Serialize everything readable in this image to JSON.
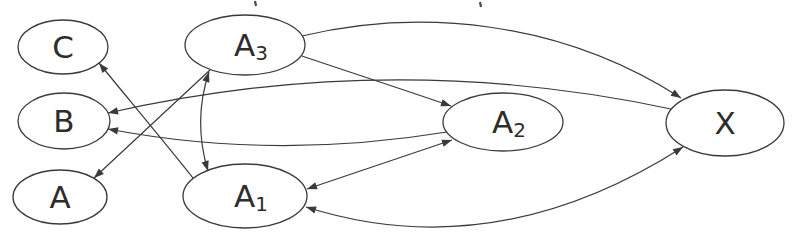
{
  "figure": {
    "type": "directed-graph",
    "width": 793,
    "height": 239,
    "background": "#ffffff",
    "stroke_color": "#3a3a3a",
    "text_color": "#2d2d2d",
    "node_fill": "#ffffff",
    "node_stroke_width": 1.3,
    "edge_stroke_width": 1.2,
    "label_font_size": 31,
    "subscript_font_size": 20,
    "arrow_length": 10,
    "arrow_half_width": 3.7,
    "nodes": [
      {
        "id": "C",
        "label": "C",
        "sub": "",
        "cx": 63,
        "cy": 47,
        "rx": 45,
        "ry": 27
      },
      {
        "id": "B",
        "label": "B",
        "sub": "",
        "cx": 64,
        "cy": 121,
        "rx": 46,
        "ry": 28
      },
      {
        "id": "A",
        "label": "A",
        "sub": "",
        "cx": 60,
        "cy": 197,
        "rx": 47,
        "ry": 27
      },
      {
        "id": "A3",
        "label": "A",
        "sub": "3",
        "cx": 245,
        "cy": 45,
        "rx": 60,
        "ry": 30
      },
      {
        "id": "A1",
        "label": "A",
        "sub": "1",
        "cx": 245,
        "cy": 196,
        "rx": 62,
        "ry": 32
      },
      {
        "id": "A2",
        "label": "A",
        "sub": "2",
        "cx": 503,
        "cy": 122,
        "rx": 60,
        "ry": 29
      },
      {
        "id": "X",
        "label": "X",
        "sub": "",
        "cx": 725,
        "cy": 123,
        "rx": 59,
        "ry": 33
      }
    ],
    "edges": [
      {
        "from": "A1",
        "to": "C",
        "arrows": "end",
        "x1": 193,
        "y1": 178,
        "c1x": 162,
        "c1y": 139,
        "c2x": 130,
        "c2y": 101,
        "x2": 99,
        "y2": 63
      },
      {
        "from": "A3",
        "to": "A",
        "arrows": "end",
        "x1": 210,
        "y1": 70,
        "c1x": 171,
        "c1y": 106,
        "c2x": 133,
        "c2y": 142,
        "x2": 94,
        "y2": 178
      },
      {
        "from": "A3",
        "to": "A1",
        "arrows": "both",
        "x1": 209,
        "y1": 72,
        "c1x": 198,
        "c1y": 105,
        "c2x": 198,
        "c2y": 138,
        "x2": 208,
        "y2": 171
      },
      {
        "from": "A3",
        "to": "A2",
        "arrows": "end",
        "x1": 302,
        "y1": 56,
        "c1x": 352,
        "c1y": 73,
        "c2x": 402,
        "c2y": 89,
        "x2": 451,
        "y2": 106
      },
      {
        "from": "A3",
        "to": "X",
        "arrows": "end",
        "x1": 302,
        "y1": 36,
        "c1x": 420,
        "c1y": 8,
        "c2x": 560,
        "c2y": 20,
        "x2": 681,
        "y2": 98
      },
      {
        "from": "X",
        "to": "B",
        "arrows": "end",
        "x1": 671,
        "y1": 109,
        "c1x": 484,
        "c1y": 69,
        "c2x": 297,
        "c2y": 70,
        "x2": 108,
        "y2": 113
      },
      {
        "from": "A2",
        "to": "B",
        "arrows": "end",
        "x1": 447,
        "y1": 132,
        "c1x": 331,
        "c1y": 151,
        "c2x": 218,
        "c2y": 150,
        "x2": 108,
        "y2": 129
      },
      {
        "from": "A1",
        "to": "A2",
        "arrows": "both",
        "x1": 307,
        "y1": 189,
        "c1x": 356,
        "c1y": 172,
        "c2x": 404,
        "c2y": 156,
        "x2": 452,
        "y2": 140
      },
      {
        "from": "A1",
        "to": "X",
        "arrows": "both",
        "x1": 306,
        "y1": 207,
        "c1x": 432,
        "c1y": 247,
        "c2x": 558,
        "c2y": 227,
        "x2": 683,
        "y2": 147
      }
    ],
    "artifacts": [
      {
        "x": 255,
        "y": 1,
        "len": 5
      },
      {
        "x": 480,
        "y": 2,
        "len": 5
      }
    ]
  }
}
